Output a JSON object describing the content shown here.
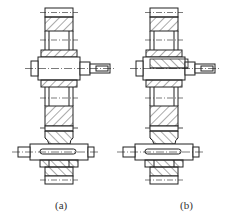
{
  "figure": {
    "panels": [
      {
        "id": "a",
        "label": "(a)",
        "variant": "plain-shaft"
      },
      {
        "id": "b",
        "label": "(b)",
        "variant": "keyed-shaft-with-sleeve"
      }
    ],
    "colors": {
      "line": "#222222",
      "hatch": "#555555",
      "background": "#ffffff"
    }
  }
}
